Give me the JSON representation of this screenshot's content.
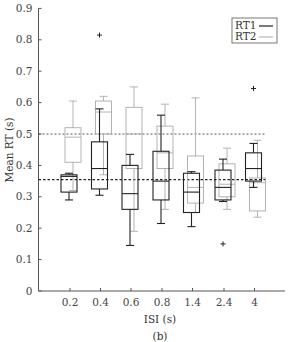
{
  "chart_data": {
    "type": "box",
    "title": "",
    "panel_label": "(b)",
    "xlabel": "ISI (s)",
    "ylabel": "Mean RT (s)",
    "ylim": [
      0,
      0.9
    ],
    "yticks": [
      0,
      0.1,
      0.2,
      0.3,
      0.4,
      0.5,
      0.6,
      0.7,
      0.8,
      0.9
    ],
    "ytick_labels": [
      "0",
      "0.1",
      "0.2",
      "0.3",
      "0.4",
      "0.5",
      "0.6",
      "0.7",
      "0.8",
      "0.9"
    ],
    "categories": [
      "0.2",
      "0.4",
      "0.6",
      "0.8",
      "1.4",
      "2.4",
      "4"
    ],
    "grid": false,
    "legend": {
      "position": "upper right",
      "entries": [
        {
          "label": "RT1",
          "color": "#222222"
        },
        {
          "label": "RT2",
          "color": "#aaaaaa"
        }
      ]
    },
    "series": [
      {
        "name": "RT1",
        "color": "#222222",
        "mean_line": 0.355,
        "boxes": [
          {
            "whisker_low": 0.29,
            "q1": 0.315,
            "median": 0.365,
            "q3": 0.37,
            "whisker_high": 0.375,
            "outliers": []
          },
          {
            "whisker_low": 0.305,
            "q1": 0.325,
            "median": 0.39,
            "q3": 0.475,
            "whisker_high": 0.58,
            "outliers": [
              0.815
            ]
          },
          {
            "whisker_low": 0.145,
            "q1": 0.26,
            "median": 0.31,
            "q3": 0.4,
            "whisker_high": 0.435,
            "outliers": []
          },
          {
            "whisker_low": 0.215,
            "q1": 0.29,
            "median": 0.35,
            "q3": 0.445,
            "whisker_high": 0.56,
            "outliers": []
          },
          {
            "whisker_low": 0.205,
            "q1": 0.25,
            "median": 0.315,
            "q3": 0.375,
            "whisker_high": 0.38,
            "outliers": []
          },
          {
            "whisker_low": 0.285,
            "q1": 0.29,
            "median": 0.33,
            "q3": 0.385,
            "whisker_high": 0.42,
            "outliers": [
              0.15
            ]
          },
          {
            "whisker_low": 0.33,
            "q1": 0.35,
            "median": 0.39,
            "q3": 0.44,
            "whisker_high": 0.47,
            "outliers": [
              0.645
            ]
          }
        ]
      },
      {
        "name": "RT2",
        "color": "#aaaaaa",
        "mean_line": 0.5,
        "boxes": [
          {
            "whisker_low": 0.32,
            "q1": 0.41,
            "median": 0.49,
            "q3": 0.52,
            "whisker_high": 0.605,
            "outliers": []
          },
          {
            "whisker_low": 0.37,
            "q1": 0.5,
            "median": 0.57,
            "q3": 0.605,
            "whisker_high": 0.62,
            "outliers": []
          },
          {
            "whisker_low": 0.19,
            "q1": 0.39,
            "median": 0.5,
            "q3": 0.585,
            "whisker_high": 0.65,
            "outliers": []
          },
          {
            "whisker_low": 0.26,
            "q1": 0.39,
            "median": 0.44,
            "q3": 0.525,
            "whisker_high": 0.595,
            "outliers": []
          },
          {
            "whisker_low": 0.25,
            "q1": 0.28,
            "median": 0.33,
            "q3": 0.43,
            "whisker_high": 0.615,
            "outliers": []
          },
          {
            "whisker_low": 0.26,
            "q1": 0.3,
            "median": 0.34,
            "q3": 0.405,
            "whisker_high": 0.455,
            "outliers": []
          },
          {
            "whisker_low": 0.235,
            "q1": 0.255,
            "median": 0.345,
            "q3": 0.36,
            "whisker_high": 0.48,
            "outliers": []
          }
        ]
      }
    ]
  }
}
